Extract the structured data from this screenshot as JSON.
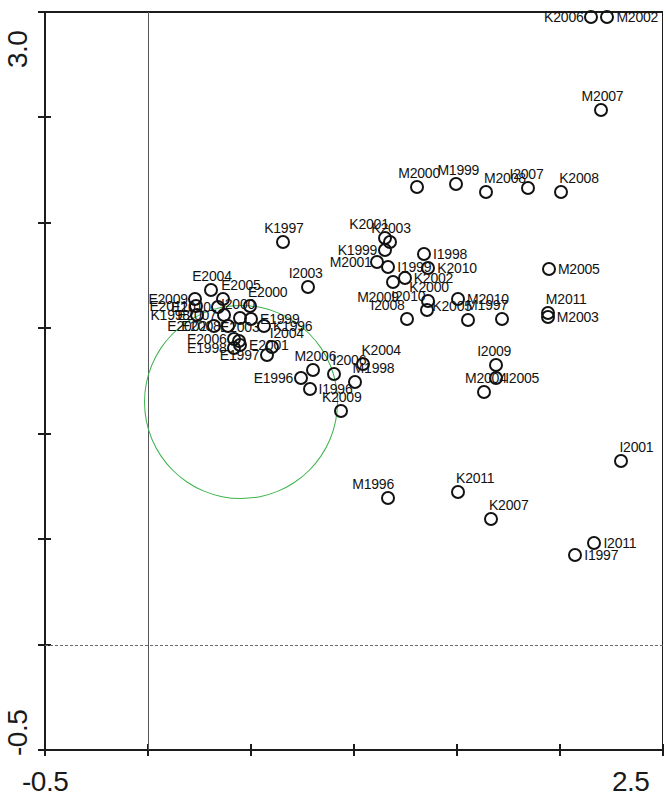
{
  "chart_data": {
    "type": "scatter",
    "title": "",
    "subtitle": "",
    "xlabel": "",
    "ylabel": "",
    "xlim": [
      -0.5,
      2.5
    ],
    "ylim": [
      -0.5,
      3.0
    ],
    "x_tick_labels": [
      "-0.5",
      "2.5"
    ],
    "y_tick_labels": [
      "3.0",
      "-0.5"
    ],
    "x_ticks": [
      -0.5,
      0.0,
      0.5,
      1.0,
      1.5,
      2.0,
      2.5
    ],
    "y_ticks": [
      3.0,
      2.5,
      2.0,
      1.5,
      1.0,
      0.5,
      0.0,
      -0.5
    ],
    "grid": false,
    "reference_lines": [
      {
        "name": "vertical-zero-line",
        "orientation": "vertical",
        "value": 0.0,
        "color": "#55555a",
        "style": "solid"
      },
      {
        "name": "horizontal-zero-line",
        "orientation": "horizontal",
        "value": 0.0,
        "color": "#6a6a72",
        "style": "dashed"
      }
    ],
    "annotations": [
      {
        "name": "cluster-ellipse",
        "shape": "ellipse",
        "color": "#3cb44b",
        "center_x": 0.45,
        "center_y": 1.15,
        "radius_x": 0.47,
        "radius_y": 0.46,
        "label": "E-group cluster"
      }
    ],
    "legend": {
      "visible": false,
      "position": "none"
    },
    "point_style": {
      "marker": "open-circle",
      "edge_color": "#121212",
      "fill": "none",
      "size_px": 14
    },
    "points": [
      {
        "label": "K2006",
        "x": 2.151,
        "y": 2.978,
        "label_side": "left"
      },
      {
        "label": "M2002",
        "x": 2.23,
        "y": 2.978,
        "label_side": "right"
      },
      {
        "label": "M2007",
        "x": 2.197,
        "y": 2.533,
        "label_side": "top"
      },
      {
        "label": "M2000",
        "x": 1.307,
        "y": 2.172,
        "label_side": "top"
      },
      {
        "label": "M1999",
        "x": 1.497,
        "y": 2.186,
        "label_side": "top"
      },
      {
        "label": "M2008",
        "x": 1.641,
        "y": 2.148,
        "label_side": "top-right"
      },
      {
        "label": "I2007",
        "x": 1.847,
        "y": 2.163,
        "label_side": "top"
      },
      {
        "label": "K2008",
        "x": 2.006,
        "y": 2.144,
        "label_side": "top-right"
      },
      {
        "label": "K1997",
        "x": 0.656,
        "y": 1.911,
        "label_side": "top"
      },
      {
        "label": "K2001",
        "x": 1.152,
        "y": 1.93,
        "label_side": "top-left"
      },
      {
        "label": "K2003",
        "x": 1.176,
        "y": 1.911,
        "label_side": "top"
      },
      {
        "label": "K1999",
        "x": 1.149,
        "y": 1.873,
        "label_side": "left"
      },
      {
        "label": "I1998",
        "x": 1.34,
        "y": 1.854,
        "label_side": "right"
      },
      {
        "label": "M2001",
        "x": 1.111,
        "y": 1.816,
        "label_side": "left"
      },
      {
        "label": "I1999",
        "x": 1.166,
        "y": 1.792,
        "label_side": "right"
      },
      {
        "label": "K2010",
        "x": 1.361,
        "y": 1.787,
        "label_side": "right"
      },
      {
        "label": "K2002",
        "x": 1.246,
        "y": 1.74,
        "label_side": "right"
      },
      {
        "label": "M2009",
        "x": 1.19,
        "y": 1.721,
        "label_side": "bottom-left"
      },
      {
        "label": "M2005",
        "x": 1.946,
        "y": 1.783,
        "label_side": "right"
      },
      {
        "label": "I2003",
        "x": 0.775,
        "y": 1.697,
        "label_side": "top"
      },
      {
        "label": "K2000",
        "x": 1.361,
        "y": 1.631,
        "label_side": "top"
      },
      {
        "label": "I2010",
        "x": 1.356,
        "y": 1.588,
        "label_side": "top-left"
      },
      {
        "label": "M2010",
        "x": 1.505,
        "y": 1.64,
        "label_side": "right"
      },
      {
        "label": "I2008",
        "x": 1.255,
        "y": 1.545,
        "label_side": "top-left"
      },
      {
        "label": "K2005",
        "x": 1.555,
        "y": 1.54,
        "label_side": "top-left"
      },
      {
        "label": "M1997",
        "x": 1.719,
        "y": 1.545,
        "label_side": "top-left"
      },
      {
        "label": "M2011",
        "x": 1.941,
        "y": 1.574,
        "label_side": "top-right"
      },
      {
        "label": "M2003",
        "x": 1.941,
        "y": 1.555,
        "label_side": "right"
      },
      {
        "label": "E2004",
        "x": 0.307,
        "y": 1.683,
        "label_side": "top"
      },
      {
        "label": "E2009",
        "x": 0.23,
        "y": 1.64,
        "label_side": "left"
      },
      {
        "label": "E2005",
        "x": 0.365,
        "y": 1.64,
        "label_side": "top-right"
      },
      {
        "label": "E2000",
        "x": 0.495,
        "y": 1.607,
        "label_side": "top-right"
      },
      {
        "label": "E2011",
        "x": 0.235,
        "y": 1.607,
        "label_side": "left"
      },
      {
        "label": "E2010",
        "x": 0.341,
        "y": 1.602,
        "label_side": "left"
      },
      {
        "label": "K1998",
        "x": 0.24,
        "y": 1.564,
        "label_side": "left"
      },
      {
        "label": "E2007",
        "x": 0.37,
        "y": 1.564,
        "label_side": "left"
      },
      {
        "label": "I2000",
        "x": 0.447,
        "y": 1.55,
        "label_side": "top"
      },
      {
        "label": "E1999",
        "x": 0.5,
        "y": 1.545,
        "label_side": "right"
      },
      {
        "label": "E2008",
        "x": 0.389,
        "y": 1.512,
        "label_side": "left"
      },
      {
        "label": "E2002",
        "x": 0.322,
        "y": 1.512,
        "label_side": "left"
      },
      {
        "label": "K1996",
        "x": 0.563,
        "y": 1.512,
        "label_side": "right"
      },
      {
        "label": "E2006",
        "x": 0.418,
        "y": 1.45,
        "label_side": "left"
      },
      {
        "label": "E2003",
        "x": 0.442,
        "y": 1.441,
        "label_side": "top"
      },
      {
        "label": "E2001",
        "x": 0.447,
        "y": 1.421,
        "label_side": "right"
      },
      {
        "label": "E1998",
        "x": 0.418,
        "y": 1.407,
        "label_side": "left"
      },
      {
        "label": "I2004",
        "x": 0.601,
        "y": 1.412,
        "label_side": "top-right"
      },
      {
        "label": "E1997",
        "x": 0.577,
        "y": 1.374,
        "label_side": "left"
      },
      {
        "label": "M2006",
        "x": 0.803,
        "y": 1.303,
        "label_side": "top"
      },
      {
        "label": "E1996",
        "x": 0.741,
        "y": 1.265,
        "label_side": "left"
      },
      {
        "label": "I2006",
        "x": 0.904,
        "y": 1.284,
        "label_side": "top-right"
      },
      {
        "label": "K2004",
        "x": 1.046,
        "y": 1.331,
        "label_side": "top-right"
      },
      {
        "label": "M1998",
        "x": 1.003,
        "y": 1.246,
        "label_side": "top-right"
      },
      {
        "label": "I1996",
        "x": 0.784,
        "y": 1.213,
        "label_side": "right"
      },
      {
        "label": "I2009",
        "x": 1.69,
        "y": 1.326,
        "label_side": "top"
      },
      {
        "label": "I2005",
        "x": 1.69,
        "y": 1.265,
        "label_side": "right"
      },
      {
        "label": "M2004",
        "x": 1.631,
        "y": 1.199,
        "label_side": "top"
      },
      {
        "label": "K2009",
        "x": 0.937,
        "y": 1.109,
        "label_side": "top"
      },
      {
        "label": "I2001",
        "x": 2.298,
        "y": 0.872,
        "label_side": "top-right"
      },
      {
        "label": "M1996",
        "x": 1.166,
        "y": 0.697,
        "label_side": "top-left"
      },
      {
        "label": "K2011",
        "x": 1.505,
        "y": 0.725,
        "label_side": "top-right"
      },
      {
        "label": "K2007",
        "x": 1.665,
        "y": 0.597,
        "label_side": "top-right"
      },
      {
        "label": "I2011",
        "x": 2.167,
        "y": 0.483,
        "label_side": "right"
      },
      {
        "label": "I1997",
        "x": 2.074,
        "y": 0.426,
        "label_side": "right"
      }
    ]
  },
  "axes": {
    "y_top_label": "3.0",
    "y_bottom_label": "-0.5",
    "x_left_label": "-0.5",
    "x_right_label": "2.5"
  }
}
